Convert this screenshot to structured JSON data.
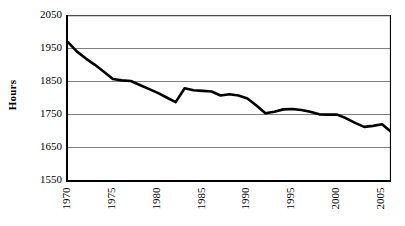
{
  "chart_data": {
    "type": "line",
    "title": "",
    "subtitle": "",
    "xlabel": "",
    "ylabel": "Hours",
    "xlim": [
      1970,
      2006
    ],
    "ylim": [
      1550,
      2050
    ],
    "y_ticks": [
      1550,
      1650,
      1750,
      1850,
      1950,
      2050
    ],
    "x_ticks": [
      1970,
      1975,
      1980,
      1985,
      1990,
      1995,
      2000,
      2005
    ],
    "x_minor_tick_step": 1,
    "grid": "horizontal",
    "legend": "none",
    "line_color": "#000000",
    "line_width_px": 2.6,
    "gridline_color": "#808080",
    "axis_color": "#000000",
    "background_color": "#ffffff",
    "x": [
      1970,
      1971,
      1972,
      1973,
      1974,
      1975,
      1976,
      1977,
      1978,
      1979,
      1980,
      1981,
      1982,
      1983,
      1984,
      1985,
      1986,
      1987,
      1988,
      1989,
      1990,
      1991,
      1992,
      1993,
      1994,
      1995,
      1996,
      1997,
      1998,
      1999,
      2000,
      2001,
      2002,
      2003,
      2004,
      2005,
      2006
    ],
    "values": [
      1968,
      1939,
      1918,
      1899,
      1878,
      1856,
      1852,
      1850,
      1838,
      1826,
      1814,
      1800,
      1786,
      1828,
      1822,
      1820,
      1818,
      1806,
      1810,
      1806,
      1797,
      1776,
      1752,
      1757,
      1764,
      1765,
      1762,
      1757,
      1749,
      1748,
      1748,
      1737,
      1723,
      1711,
      1714,
      1719,
      1696
    ],
    "series": [
      {
        "name": "Hours",
        "values": [
          1968,
          1939,
          1918,
          1899,
          1878,
          1856,
          1852,
          1850,
          1838,
          1826,
          1814,
          1800,
          1786,
          1828,
          1822,
          1820,
          1818,
          1806,
          1810,
          1806,
          1797,
          1776,
          1752,
          1757,
          1764,
          1765,
          1762,
          1757,
          1749,
          1748,
          1748,
          1737,
          1723,
          1711,
          1714,
          1719,
          1696
        ]
      }
    ],
    "y_tick_labels": [
      "2050",
      "1950",
      "1850",
      "1750",
      "1650",
      "1550"
    ],
    "x_tick_labels": [
      "1970",
      "1975",
      "1980",
      "1985",
      "1990",
      "1995",
      "2000",
      "2005"
    ],
    "annotations": []
  },
  "axis": {
    "y_title": "Hours"
  }
}
